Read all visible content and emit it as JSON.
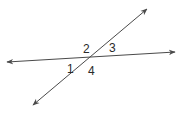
{
  "diagram": {
    "type": "intersecting-lines",
    "line_color": "#4a4a4a",
    "label_color": "#2a2a2a",
    "lines": [
      {
        "name": "transversal-line",
        "x1": 33,
        "y1": 105,
        "x2": 147,
        "y2": 9
      },
      {
        "name": "horizontal-line",
        "x1": 7,
        "y1": 62,
        "x2": 175,
        "y2": 52
      }
    ],
    "intersection": {
      "x": 90,
      "y": 57
    },
    "angle_labels": [
      {
        "text": "1",
        "x": 67,
        "y": 73
      },
      {
        "text": "2",
        "x": 83,
        "y": 53
      },
      {
        "text": "3",
        "x": 109,
        "y": 52
      },
      {
        "text": "4",
        "x": 88,
        "y": 75
      }
    ]
  }
}
